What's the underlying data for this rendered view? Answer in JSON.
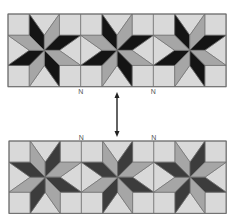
{
  "diagram": {
    "colors": {
      "background": "#ffffff",
      "light": "#d9d9d9",
      "gray": "#a6a6a6",
      "dark_top": "#141414",
      "dark_bottom": "#3c3c3c",
      "seam": "#6e6e6e",
      "arrow": "#222222"
    },
    "strips": [
      {
        "name": "top-strip",
        "dark_color_key": "dark_top",
        "blocks": [
          {
            "name": "star-block-1",
            "dark_diamonds": [
              0,
              2,
              4,
              6
            ]
          },
          {
            "name": "star-block-2",
            "dark_diamonds": [
              0,
              2,
              4,
              6
            ]
          },
          {
            "name": "star-block-3",
            "dark_diamonds": [
              0,
              2,
              4,
              6
            ]
          }
        ],
        "markers": [
          {
            "name": "seam-marker-1",
            "glyph": "N"
          },
          {
            "name": "seam-marker-2",
            "glyph": "N"
          }
        ]
      },
      {
        "name": "bottom-strip",
        "dark_color_key": "dark_bottom",
        "blocks": [
          {
            "name": "star-block-1",
            "dark_diamonds": [
              1,
              3,
              5,
              7
            ]
          },
          {
            "name": "star-block-2",
            "dark_diamonds": [
              1,
              3,
              5,
              7
            ]
          },
          {
            "name": "star-block-3",
            "dark_diamonds": [
              1,
              3,
              5,
              7
            ]
          }
        ],
        "markers": [
          {
            "name": "seam-marker-1",
            "glyph": "N"
          },
          {
            "name": "seam-marker-2",
            "glyph": "N"
          }
        ]
      }
    ],
    "arrow": {
      "name": "double-headed-arrow",
      "direction": "vertical",
      "heads": "both"
    }
  }
}
